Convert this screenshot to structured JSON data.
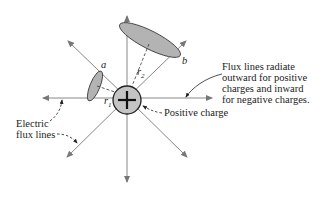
{
  "diagram": {
    "center_symbol": "+",
    "labels": {
      "a": "a",
      "b": "b",
      "r1": "r",
      "r1_sub": "1",
      "r2": "r",
      "r2_sub": "2",
      "positive_charge": "Positive charge",
      "electric_flux_lines_1": "Electric",
      "electric_flux_lines_2": "flux lines",
      "note_1": "Flux lines radiate",
      "note_2": "outward for positive",
      "note_3": "charges and inward",
      "note_4": "for negative charges."
    },
    "colors": {
      "line": "#888888",
      "fill": "#b3b3b3",
      "stroke": "#333333",
      "text": "#222222"
    }
  }
}
